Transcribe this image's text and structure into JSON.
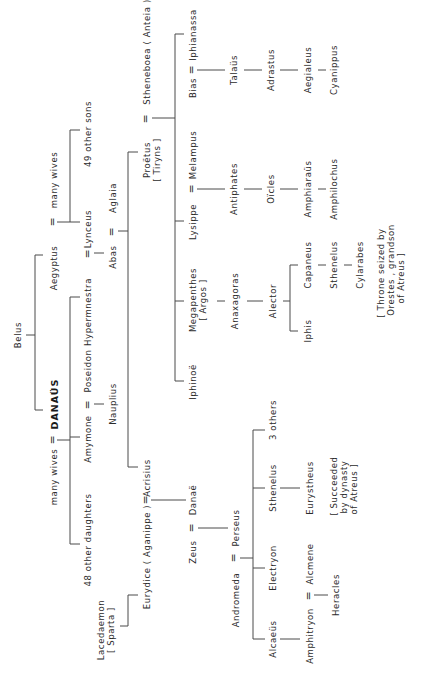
{
  "diagram": {
    "type": "genealogy",
    "orientation": "rotated-90-ccw",
    "marriage_symbol": "="
  },
  "nodes": {
    "belus": "Belus",
    "aegyptus": "Aegyptus",
    "aegyptus_wives": "many wives",
    "danaus": "DANAÜS",
    "danaus_wives": "many wives",
    "lynceus": "Lynceus",
    "other_sons": "49 other sons",
    "hypermnestra": "Hypermnestra",
    "amymone": "Amymone",
    "poseidon": "Poseidon",
    "nauplius": "Nauplius",
    "other_daughters": "48 other daughters",
    "abas": "Abas",
    "aglaia": "Aglaia",
    "proetus": "Proëtus",
    "proetus_note": "[ Tiryns ]",
    "stheneboea": "Stheneboea ( Anteia )",
    "acrisius": "Acrisius",
    "eurydice": "Eurydice ( Aganippe )",
    "lacedaemon": "Lacedaemon",
    "lacedaemon_note": "[ Sparta ]",
    "iphinoe": "Iphinoë",
    "megapenthes": "Megapenthes",
    "megapenthes_note": "[ Argos ]",
    "lysippe": "Lysippe",
    "melampus": "Melampus",
    "bias": "Bias",
    "iphianassa": "Iphianassa",
    "anaxagoras": "Anaxagoras",
    "alector": "Alector",
    "iphis": "Iphis",
    "capaneus": "Capaneus",
    "sthenelus_1": "Sthenelus",
    "cylarabes": "Cylarabes",
    "throne_note_1": "[ Throne  seized  by",
    "throne_note_2": "Orestes , grandson",
    "throne_note_3": "of  Atreus ]",
    "antiphates": "Antiphates",
    "oicles": "Oïcles",
    "amphiaraus": "Amphiaraüs",
    "amphilochus": "Amphilochus",
    "talaus": "Talaüs",
    "adrastus": "Adrastus",
    "aegialeus": "Aegialeus",
    "cyanippus": "Cyanippus",
    "danae": "Danaë",
    "zeus": "Zeus",
    "perseus": "Perseus",
    "andromeda": "Andromeda",
    "three_others": "3 others",
    "sthenelus_2": "Sthenelus",
    "eurystheus": "Eurystheus",
    "succeeded_note_1": "[ Succeeded",
    "succeeded_note_2": "by  dynasty",
    "succeeded_note_3": "of  Atreus ]",
    "electryon": "Electryon",
    "alcmene": "Alcmene",
    "alcaeus": "Alcaeüs",
    "amphitryon": "Amphitryon",
    "heracles": "Heracles"
  },
  "relations": [
    {
      "type": "child",
      "parent": "Belus",
      "children": [
        "Aegyptus",
        "DANAÜS"
      ]
    },
    {
      "type": "marriage",
      "a": "Aegyptus",
      "b": "many wives",
      "children": [
        "Lynceus",
        "49 other sons"
      ]
    },
    {
      "type": "marriage",
      "a": "DANAÜS",
      "b": "many wives",
      "children": [
        "Hypermnestra",
        "Amymone",
        "48 other daughters"
      ]
    },
    {
      "type": "marriage",
      "a": "Hypermnestra",
      "b": "Lynceus",
      "children": [
        "Abas"
      ]
    },
    {
      "type": "marriage",
      "a": "Amymone",
      "b": "Poseidon",
      "children": [
        "Nauplius"
      ]
    },
    {
      "type": "marriage",
      "a": "Abas",
      "b": "Aglaia",
      "children": [
        "Proëtus",
        "Acrisius"
      ]
    },
    {
      "type": "marriage",
      "a": "Proëtus",
      "b": "Stheneboea ( Anteia )",
      "children": [
        "Iphinoë",
        "Megapenthes",
        "Lysippe",
        "Iphianassa"
      ]
    },
    {
      "type": "marriage",
      "a": "Lysippe",
      "b": "Melampus",
      "children": [
        "Antiphates"
      ]
    },
    {
      "type": "marriage",
      "a": "Bias",
      "b": "Iphianassa",
      "children": [
        "Talaüs"
      ]
    },
    {
      "type": "marriage",
      "a": "Acrisius",
      "b": "Eurydice ( Aganippe )",
      "children": [
        "Danaë"
      ]
    },
    {
      "type": "child",
      "parent": "Lacedaemon",
      "children": [
        "Eurydice ( Aganippe )"
      ]
    },
    {
      "type": "marriage",
      "a": "Zeus",
      "b": "Danaë",
      "children": [
        "Perseus"
      ]
    },
    {
      "type": "marriage",
      "a": "Andromeda",
      "b": "Perseus",
      "children": [
        "Alcaeüs",
        "Electryon",
        "Sthenelus",
        "3 others"
      ]
    },
    {
      "type": "marriage",
      "a": "Amphitryon",
      "b": "Alcmene",
      "children": [
        "Heracles"
      ]
    }
  ]
}
